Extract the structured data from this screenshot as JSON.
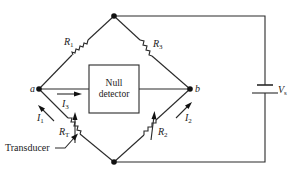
{
  "diagram": {
    "type": "Wheatstone bridge circuit",
    "nodes": {
      "a": "a",
      "b": "b"
    },
    "resistors": {
      "r1": {
        "main": "R",
        "sub": "1"
      },
      "r2": {
        "main": "R",
        "sub": "2"
      },
      "r3": {
        "main": "R",
        "sub": "3"
      },
      "rt": {
        "main": "R",
        "sub": "T"
      }
    },
    "currents": {
      "i1": {
        "main": "I",
        "sub": "1"
      },
      "i2": {
        "main": "I",
        "sub": "2"
      },
      "i3": {
        "main": "I",
        "sub": "3"
      }
    },
    "detector": {
      "line1": "Null",
      "line2": "detector"
    },
    "source": {
      "main": "V",
      "sub": "s"
    },
    "annotation": "Transducer",
    "colors": {
      "line": "#2a2a2a",
      "background": "#ffffff"
    }
  }
}
